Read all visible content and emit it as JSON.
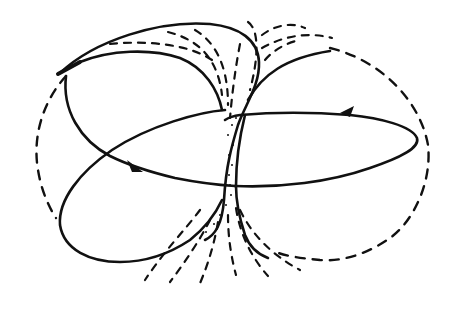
{
  "figure": {
    "type": "line-drawing",
    "colors": {
      "ink": "#111111",
      "background": "#ffffff"
    },
    "elements": {
      "outer_boundary": "dashed circle",
      "orbit_curves": [
        "upper-left loop",
        "lower-left lobe",
        "right elongated lobe",
        "upper arc"
      ],
      "arrows": [
        {
          "location": "left-center",
          "direction": "right-down"
        },
        {
          "location": "upper-right",
          "direction": "left"
        }
      ],
      "central_column": "stippled narrow band",
      "fan_lines": [
        "upper fan (dashed)",
        "lower fan (dashed)"
      ]
    },
    "text": []
  }
}
